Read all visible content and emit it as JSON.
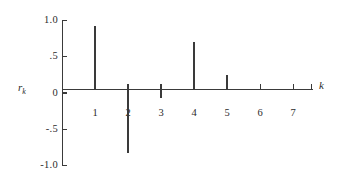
{
  "chart_data": {
    "type": "bar",
    "title": "",
    "subtitle": "",
    "xlabel": "k",
    "ylabel": "r_k",
    "categories": [
      1,
      2,
      3,
      4,
      5,
      6,
      7
    ],
    "values": [
      0.93,
      -0.83,
      -0.07,
      0.7,
      0.25,
      0.05,
      0.0
    ],
    "x": [
      1,
      2,
      3,
      4,
      5,
      6,
      7
    ],
    "xlim": [
      0,
      7.6
    ],
    "ylim": [
      -1.0,
      1.0
    ],
    "yticks": [
      1.0,
      0.5,
      0.0,
      -0.5,
      -1.0
    ],
    "ytick_labels": [
      "1.0",
      ".5",
      "0",
      "-.5",
      "-1.0"
    ],
    "xticks": [
      1,
      2,
      3,
      4,
      5,
      6,
      7
    ],
    "xtick_labels": [
      "1",
      "2",
      "3",
      "4",
      "5",
      "6",
      "7"
    ],
    "grid": false,
    "legend": null,
    "annotations": [],
    "series": [
      {
        "name": "r_k",
        "values": [
          0.93,
          -0.83,
          -0.07,
          0.7,
          0.25,
          0.05,
          0.0
        ]
      }
    ]
  },
  "axes": {
    "y_title_main": "r",
    "y_title_sub": "k",
    "x_title": "k"
  },
  "style": {
    "line_color": "#3a3a3a",
    "background": "#ffffff",
    "text_color": "#2b2b2b"
  }
}
